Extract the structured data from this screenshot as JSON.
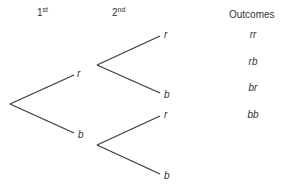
{
  "headers": {
    "first": {
      "num": "1",
      "suffix": "st"
    },
    "second": {
      "num": "2",
      "suffix": "nd"
    },
    "outcomes": "Outcomes"
  },
  "tree": {
    "first_level": [
      {
        "label": "r"
      },
      {
        "label": "b"
      }
    ],
    "second_level": [
      {
        "label": "r"
      },
      {
        "label": "b"
      },
      {
        "label": "r"
      },
      {
        "label": "b"
      }
    ]
  },
  "outcomes": [
    "rr",
    "rb",
    "br",
    "bb"
  ],
  "colors": {
    "line": "#3a3a3a",
    "text": "#333333"
  }
}
